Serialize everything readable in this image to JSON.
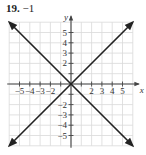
{
  "problem": {
    "number": "19.",
    "answer": "−1"
  },
  "chart_data": {
    "type": "line",
    "title": "19. −1",
    "xlabel": "x",
    "ylabel": "y",
    "xlim": [
      -6,
      6
    ],
    "ylim": [
      -6,
      6
    ],
    "grid": true,
    "x_tick_labels": [
      "−5",
      "−4",
      "−3",
      "−2",
      "2",
      "3",
      "4",
      "5"
    ],
    "x_tick_values": [
      -5,
      -4,
      -3,
      -2,
      2,
      3,
      4,
      5
    ],
    "y_tick_labels": [
      "5",
      "4",
      "3",
      "2",
      "−2",
      "−3",
      "−4",
      "−5"
    ],
    "y_tick_values": [
      5,
      4,
      3,
      2,
      -2,
      -3,
      -4,
      -5
    ],
    "series": [
      {
        "name": "y = x",
        "x": [
          -6,
          6
        ],
        "y": [
          -6,
          6
        ],
        "arrows": "both"
      },
      {
        "name": "y = -x",
        "x": [
          -6,
          6
        ],
        "y": [
          6,
          -6
        ],
        "arrows": "both"
      }
    ],
    "colors": {
      "line": "#222222",
      "grid": "#d9d9d9",
      "axis": "#444444"
    }
  }
}
